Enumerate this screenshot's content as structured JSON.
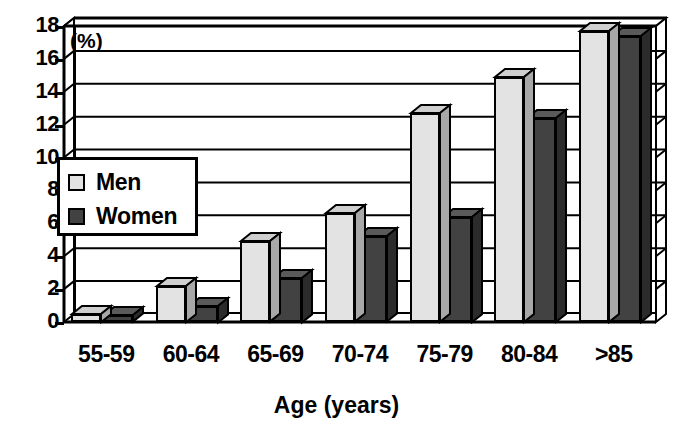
{
  "chart_data": {
    "type": "bar",
    "title": "",
    "xlabel": "Age (years)",
    "ylabel": "(%)",
    "unit_label": "(%)",
    "categories": [
      "55-59",
      "60-64",
      "65-69",
      "70-74",
      "75-79",
      "80-84",
      ">85"
    ],
    "series": [
      {
        "name": "Men",
        "color": "#e3e3e3",
        "values": [
          0.5,
          2.2,
          4.9,
          6.6,
          12.7,
          14.9,
          17.7
        ]
      },
      {
        "name": "Women",
        "color": "#424242",
        "values": [
          0.4,
          1.0,
          2.7,
          5.2,
          6.4,
          12.4,
          17.4
        ]
      }
    ],
    "ylim": [
      0,
      18
    ],
    "yticks": [
      "18",
      "16",
      "14",
      "12",
      "10",
      "8",
      "6",
      "4",
      "2",
      "0"
    ],
    "ytick_values": [
      18,
      16,
      14,
      12,
      10,
      8,
      6,
      4,
      2,
      0
    ],
    "grid": true,
    "legend_position": "inside-left",
    "style": "3d-column"
  },
  "legend": {
    "items": [
      {
        "label": "Men"
      },
      {
        "label": "Women"
      }
    ]
  }
}
